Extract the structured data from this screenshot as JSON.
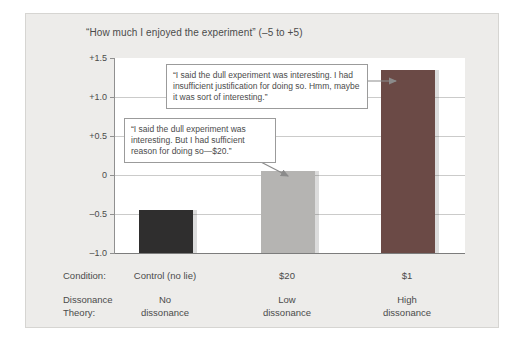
{
  "chart": {
    "title": "“How much I enjoyed the experiment” (–5 to +5)"
  },
  "chart_data": {
    "type": "bar",
    "title": "“How much I enjoyed the experiment” (–5 to +5)",
    "categories": [
      "Control (no lie)",
      "$20",
      "$1"
    ],
    "values": [
      -0.45,
      0.05,
      1.35
    ],
    "bar_colors": [
      "#2f2e2e",
      "#b5b4b2",
      "#6b4a46"
    ],
    "xlabel": "",
    "ylabel": "",
    "ylim": [
      -1.0,
      1.5
    ],
    "grid": "horizontal",
    "yticks": [
      {
        "label": "+1.5",
        "value": 1.5,
        "gridline": false
      },
      {
        "label": "+1.0",
        "value": 1.0,
        "gridline": true
      },
      {
        "label": "+0.5",
        "value": 0.5,
        "gridline": true
      },
      {
        "label": "0",
        "value": 0.0,
        "gridline": true
      },
      {
        "label": "–0.5",
        "value": -0.5,
        "gridline": true
      },
      {
        "label": "–1.0",
        "value": -1.0,
        "gridline": false
      }
    ],
    "condition_row": {
      "header": "Condition:",
      "values": [
        "Control (no lie)",
        "$20",
        "$1"
      ]
    },
    "dissonance_row": {
      "header": "Dissonance\nTheory:",
      "values": [
        "No\ndissonance",
        "Low\ndissonance",
        "High\ndissonance"
      ]
    }
  },
  "callouts": [
    {
      "text": "“I said the dull experiment was interesting. I had insufficient justification for doing so. Hmm, maybe it was sort of interesting.”",
      "points_to": "$1"
    },
    {
      "text": "“I said the dull experiment was interesting. But I had sufficient reason for doing so—$20.”",
      "points_to": "$20"
    }
  ],
  "colors": {
    "panel_background": "#edecea",
    "plot_background": "#ffffff",
    "gridline": "#cbcbca",
    "axis": "#909090",
    "text": "#4b4b4b",
    "bar_control": "#2f2e2e",
    "bar_twenty": "#b5b4b2",
    "bar_one": "#6b4a46",
    "arrow": "#8b8b8b"
  }
}
